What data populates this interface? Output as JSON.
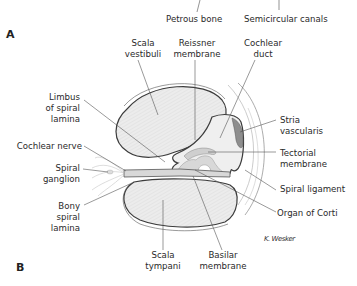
{
  "panels": {
    "a": "A",
    "b": "B"
  },
  "top_labels": {
    "petrous_bone": "Petrous bone",
    "semicircular_canals": "Semicircular canals"
  },
  "labels": {
    "scala_vestibuli": [
      "Scala",
      "vestibuli"
    ],
    "reissner_membrane": [
      "Reissner",
      "membrane"
    ],
    "cochlear_duct": [
      "Cochlear",
      "duct"
    ],
    "limbus": [
      "Limbus",
      "of spiral",
      "lamina"
    ],
    "cochlear_nerve": "Cochlear nerve",
    "spiral_ganglion": [
      "Spiral",
      "ganglion"
    ],
    "bony_spiral_lamina": [
      "Bony",
      "spiral",
      "lamina"
    ],
    "stria_vascularis": [
      "Stria",
      "vascularis"
    ],
    "tectorial_membrane": [
      "Tectorial",
      "membrane"
    ],
    "spiral_ligament": "Spiral ligament",
    "organ_of_corti": "Organ of Corti",
    "scala_tympani": [
      "Scala",
      "tympani"
    ],
    "basilar_membrane": [
      "Basilar",
      "membrane"
    ]
  },
  "signature": "K. Wesker",
  "colors": {
    "fill_light": "#e9e9e9",
    "fill_mid": "#d6d6d6",
    "stria": "#8e8e8e",
    "outline": "#3c3c3c",
    "leader": "#555555"
  }
}
